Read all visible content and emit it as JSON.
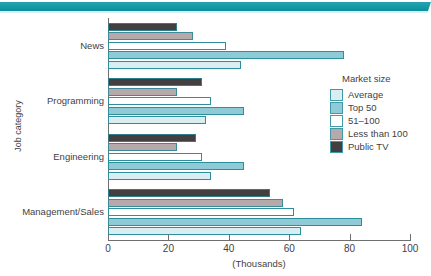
{
  "banner": {
    "color": "#139aa6"
  },
  "chart_data": {
    "type": "bar",
    "orientation": "horizontal",
    "title": "",
    "xlabel": "(Thousands)",
    "ylabel": "Job category",
    "xlim": [
      0,
      100
    ],
    "xticks": [
      "0",
      "20",
      "40",
      "60",
      "80",
      "100"
    ],
    "grid": false,
    "legend_title": "Market size",
    "legend_position": "right",
    "categories": [
      "News",
      "Programming",
      "Engineering",
      "Management/Sales"
    ],
    "series": [
      {
        "name": "Average",
        "color": "#d8eef2",
        "values": [
          44,
          32.5,
          34,
          64
        ]
      },
      {
        "name": "Top 50",
        "color": "#8ecbd6",
        "values": [
          78,
          45,
          45,
          84
        ]
      },
      {
        "name": "51–100",
        "color": "#ffffff",
        "values": [
          39,
          34,
          31,
          61.5
        ]
      },
      {
        "name": "Less than 100",
        "color": "#b7a9ab",
        "values": [
          28,
          23,
          23,
          58
        ]
      },
      {
        "name": "Public TV",
        "color": "#433f40",
        "values": [
          23,
          31,
          29,
          53.5
        ]
      }
    ]
  }
}
